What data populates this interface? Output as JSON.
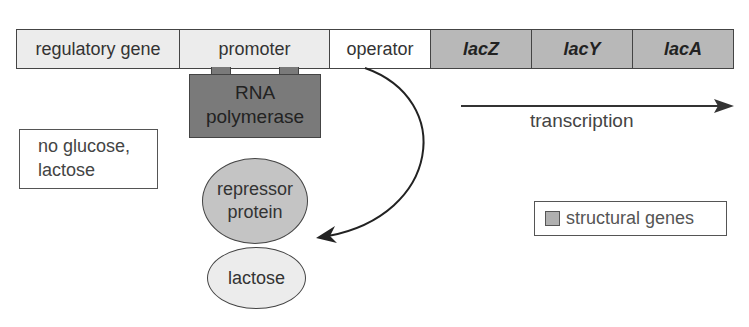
{
  "operon": {
    "segments": [
      {
        "label": "regulatory gene",
        "type": "regulatory"
      },
      {
        "label": "promoter",
        "type": "promoter"
      },
      {
        "label": "operator",
        "type": "operator"
      },
      {
        "label": "lacZ",
        "type": "structural"
      },
      {
        "label": "lacY",
        "type": "structural"
      },
      {
        "label": "lacA",
        "type": "structural"
      }
    ]
  },
  "rna_polymerase": {
    "line1": "RNA",
    "line2": "polymerase"
  },
  "condition": {
    "line1": "no glucose,",
    "line2": "lactose"
  },
  "repressor": {
    "line1": "repressor",
    "line2": "protein"
  },
  "lactose": {
    "label": "lactose"
  },
  "transcription": {
    "label": "transcription"
  },
  "legend": {
    "label": "structural genes",
    "swatch_color": "#b0b0b0"
  },
  "colors": {
    "regulatory": "#ececec",
    "promoter": "#ececec",
    "operator": "#ffffff",
    "structural": "#b8b8b8",
    "polymerase": "#7a7a7a",
    "repressor": "#c4c4c4",
    "lactose": "#ececec"
  }
}
